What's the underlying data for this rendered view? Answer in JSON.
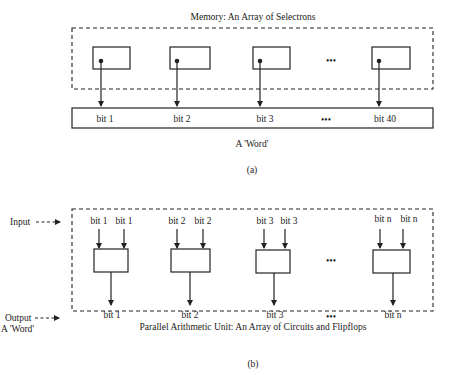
{
  "part_a": {
    "title": "Memory: An Array of Selectrons",
    "word_bits": [
      "bit 1",
      "bit 2",
      "bit 3",
      "bit 40"
    ],
    "ellipsis": "•••",
    "word_label": "A 'Word'",
    "caption": "(a)"
  },
  "part_b": {
    "input_label": "Input",
    "output_label": "Output",
    "output_sublabel": "A 'Word'",
    "units": [
      {
        "in1": "bit 1",
        "in2": "bit 1",
        "out": "bit 1"
      },
      {
        "in1": "bit 2",
        "in2": "bit 2",
        "out": "bit 2"
      },
      {
        "in1": "bit 3",
        "in2": "bit 3",
        "out": "bit 3"
      },
      {
        "in1": "bit n",
        "in2": "bit n",
        "out": "bit n"
      }
    ],
    "ellipsis": "•••",
    "title": "Parallel Arithmetic Unit: An Array of Circuits and Flipflops",
    "caption": "(b)"
  }
}
